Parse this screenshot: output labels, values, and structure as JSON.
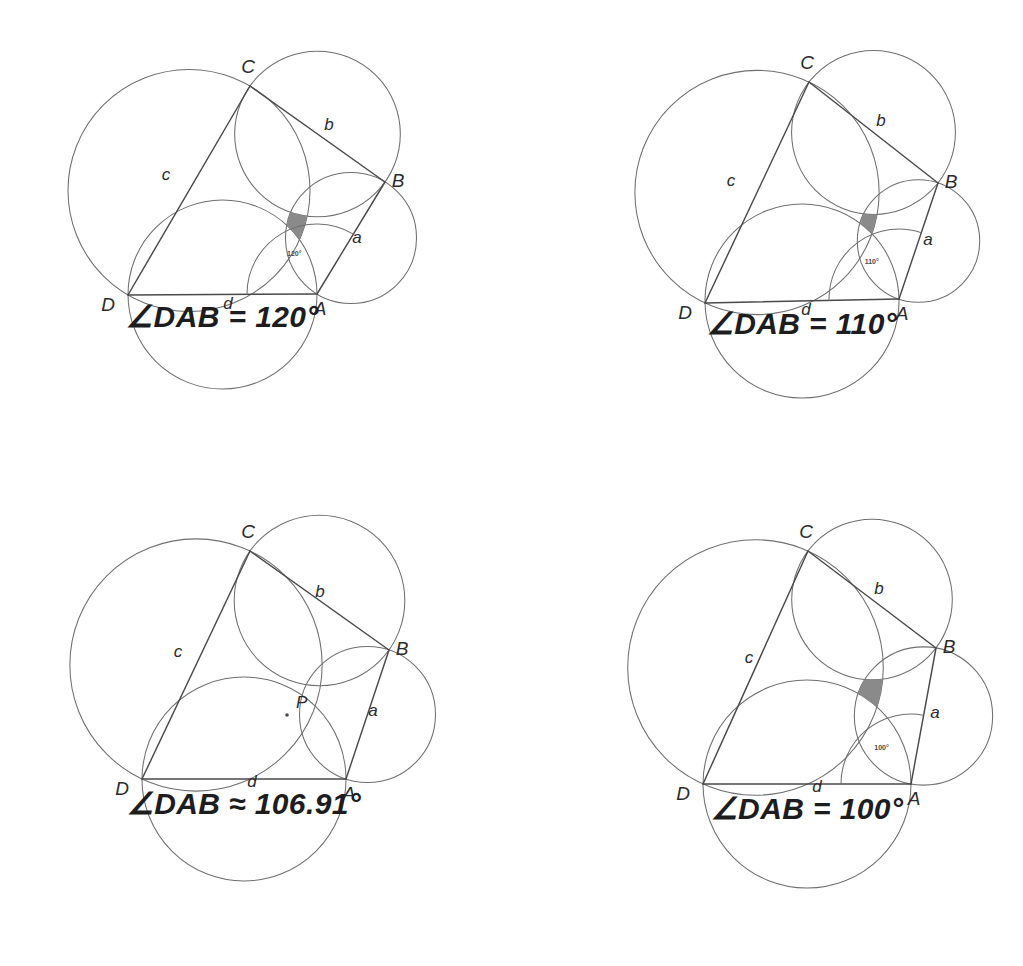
{
  "figure": {
    "panel_count": 4,
    "colors": {
      "background": "#ffffff",
      "circle_stroke": "#6f6f72",
      "side_stroke": "#4a4a4d",
      "shade_fill": "#8a8a8a",
      "label_text": "#2b2b2d",
      "caption_text": "#1d1d1f"
    }
  },
  "panels": [
    {
      "id": "panel-120",
      "caption": "∠DAB = 120°",
      "angle_value": 120,
      "angle_mini_label": "120°",
      "has_shaded_region": true,
      "has_concurrency_point": false,
      "point_label": "",
      "vertices": [
        {
          "name": "A",
          "label": "A",
          "x": 317,
          "y": 294
        },
        {
          "name": "B",
          "label": "B",
          "x": 385,
          "y": 182
        },
        {
          "name": "C",
          "label": "C",
          "x": 250,
          "y": 86
        },
        {
          "name": "D",
          "label": "D",
          "x": 128,
          "y": 295
        }
      ],
      "side_labels": [
        {
          "name": "a",
          "label": "a",
          "x": 357,
          "y": 243
        },
        {
          "name": "b",
          "label": "b",
          "x": 329,
          "y": 130
        },
        {
          "name": "c",
          "label": "c",
          "x": 166,
          "y": 180
        },
        {
          "name": "d",
          "label": "d",
          "x": 228,
          "y": 309
        }
      ]
    },
    {
      "id": "panel-110",
      "caption": "∠DAB = 110°",
      "angle_value": 110,
      "angle_mini_label": "110°",
      "has_shaded_region": true,
      "has_concurrency_point": false,
      "point_label": "",
      "vertices": [
        {
          "name": "A",
          "label": "A",
          "x": 899,
          "y": 299
        },
        {
          "name": "B",
          "label": "B",
          "x": 938,
          "y": 183
        },
        {
          "name": "C",
          "label": "C",
          "x": 809,
          "y": 82
        },
        {
          "name": "D",
          "label": "D",
          "x": 705,
          "y": 303
        }
      ],
      "side_labels": [
        {
          "name": "a",
          "label": "a",
          "x": 928,
          "y": 245
        },
        {
          "name": "b",
          "label": "b",
          "x": 881,
          "y": 126
        },
        {
          "name": "c",
          "label": "c",
          "x": 731,
          "y": 186
        },
        {
          "name": "d",
          "label": "d",
          "x": 806,
          "y": 315
        }
      ]
    },
    {
      "id": "panel-10691",
      "caption": "∠DAB ≈ 106.91°",
      "angle_value": 106.91,
      "angle_mini_label": "",
      "has_shaded_region": false,
      "has_concurrency_point": true,
      "point_label": "P",
      "vertices": [
        {
          "name": "A",
          "label": "A",
          "x": 346,
          "y": 779
        },
        {
          "name": "B",
          "label": "B",
          "x": 389,
          "y": 650
        },
        {
          "name": "C",
          "label": "C",
          "x": 250,
          "y": 551
        },
        {
          "name": "D",
          "label": "D",
          "x": 142,
          "y": 779
        }
      ],
      "side_labels": [
        {
          "name": "a",
          "label": "a",
          "x": 373,
          "y": 716
        },
        {
          "name": "b",
          "label": "b",
          "x": 320,
          "y": 597
        },
        {
          "name": "c",
          "label": "c",
          "x": 178,
          "y": 657
        },
        {
          "name": "d",
          "label": "d",
          "x": 252,
          "y": 787
        }
      ],
      "concurrency": {
        "x": 287,
        "y": 715
      }
    },
    {
      "id": "panel-100",
      "caption": "∠DAB = 100°",
      "angle_value": 100,
      "angle_mini_label": "100°",
      "has_shaded_region": true,
      "has_concurrency_point": false,
      "point_label": "",
      "vertices": [
        {
          "name": "A",
          "label": "A",
          "x": 911,
          "y": 784
        },
        {
          "name": "B",
          "label": "B",
          "x": 936,
          "y": 648
        },
        {
          "name": "C",
          "label": "C",
          "x": 808,
          "y": 551
        },
        {
          "name": "D",
          "label": "D",
          "x": 703,
          "y": 784
        }
      ],
      "side_labels": [
        {
          "name": "a",
          "label": "a",
          "x": 935,
          "y": 718
        },
        {
          "name": "b",
          "label": "b",
          "x": 879,
          "y": 594
        },
        {
          "name": "c",
          "label": "c",
          "x": 749,
          "y": 663
        },
        {
          "name": "d",
          "label": "d",
          "x": 817,
          "y": 792
        }
      ]
    }
  ],
  "chart_data": {
    "type": "diagram",
    "series": [
      {
        "panel": "panel-120",
        "angle_DAB_deg": 120,
        "central_region": "shaded curvilinear quadrilateral",
        "concurrent": false
      },
      {
        "panel": "panel-110",
        "angle_DAB_deg": 110,
        "central_region": "small shaded curvilinear quadrilateral",
        "concurrent": false
      },
      {
        "panel": "panel-10691",
        "angle_DAB_deg": 106.91,
        "central_region": "degenerate point P",
        "concurrent": true
      },
      {
        "panel": "panel-100",
        "angle_DAB_deg": 100,
        "central_region": "shaded curvilinear quadrilateral (reversed orientation)",
        "concurrent": false
      }
    ],
    "vertex_labels": [
      "A",
      "B",
      "C",
      "D"
    ],
    "side_labels": [
      "a",
      "b",
      "c",
      "d"
    ],
    "side_label_meaning": {
      "a": "AB",
      "b": "BC",
      "c": "CD",
      "d": "DA"
    },
    "annotations": [
      "∠DAB = 120°",
      "∠DAB = 110°",
      "∠DAB ≈ 106.91°",
      "∠DAB = 100°"
    ],
    "grid": false,
    "legend": "none"
  }
}
